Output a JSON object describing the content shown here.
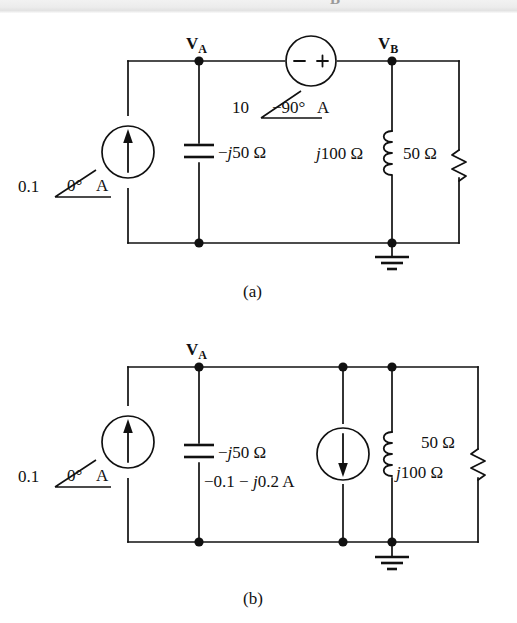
{
  "page": {
    "top_strip_ghost_text": "B"
  },
  "figure_a": {
    "caption": "(a)",
    "nodes": [
      {
        "name": "V",
        "subscript": "A"
      },
      {
        "name": "V",
        "subscript": "B"
      }
    ],
    "current_source": {
      "magnitude": "0.1",
      "angle": "0°",
      "unit": "A",
      "direction": "up",
      "label": "0.1 ∠0° A"
    },
    "voltage_source": {
      "magnitude": "10",
      "angle": "−90°",
      "unit": "A",
      "minus_sign": "−",
      "plus_sign": "+",
      "label": "10 ∠−90° A"
    },
    "capacitor": {
      "label": "−j50 Ω"
    },
    "inductor": {
      "label": "j100 Ω"
    },
    "resistor": {
      "label": "50 Ω"
    },
    "ground": {
      "label": "ground"
    }
  },
  "figure_b": {
    "caption": "(b)",
    "nodes": [
      {
        "name": "V",
        "subscript": "A"
      }
    ],
    "current_source_left": {
      "magnitude": "0.1",
      "angle": "0°",
      "unit": "A",
      "direction": "up",
      "label": "0.1 ∠0° A"
    },
    "current_source_right": {
      "direction": "down",
      "label": "−0.1 − j0.2 A"
    },
    "capacitor": {
      "label": "−j50 Ω"
    },
    "inductor": {
      "label": "j100 Ω"
    },
    "resistor": {
      "label": "50 Ω"
    },
    "ground": {
      "label": "ground"
    }
  },
  "colors": {
    "ink": "#111111",
    "paper": "#ffffff",
    "strip": "#ececec"
  }
}
